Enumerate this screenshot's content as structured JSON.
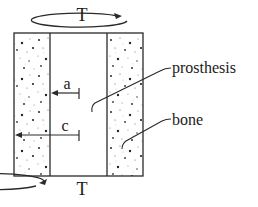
{
  "diagram": {
    "torque_top": {
      "label": "T",
      "icon": "torque-arrow-icon"
    },
    "torque_bottom": {
      "label": "T",
      "icon": "torque-arrow-icon"
    },
    "dimensions": {
      "inner_radius": {
        "label": "a"
      },
      "outer_radius": {
        "label": "c"
      }
    },
    "callouts": {
      "prosthesis": "prosthesis",
      "bone": "bone"
    },
    "colors": {
      "line": "#2a2a2a",
      "background": "#ffffff",
      "speckle": "#333333"
    }
  }
}
